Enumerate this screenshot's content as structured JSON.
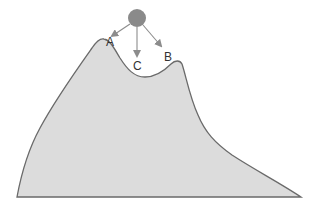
{
  "diagram": {
    "colors": {
      "mountain_fill": "#dcdcdc",
      "mountain_stroke": "#6a6a6a",
      "ball_fill": "#8a8a8a",
      "arrow": "#8c8c8c",
      "label": "#333333"
    },
    "ball": {
      "name": "ball",
      "cx": 137,
      "cy": 18,
      "r": 9
    },
    "points": [
      {
        "id": "A",
        "label": "A",
        "description": "left (higher) peak"
      },
      {
        "id": "C",
        "label": "C",
        "description": "valley between peaks"
      },
      {
        "id": "B",
        "label": "B",
        "description": "right (lower) peak"
      }
    ]
  }
}
